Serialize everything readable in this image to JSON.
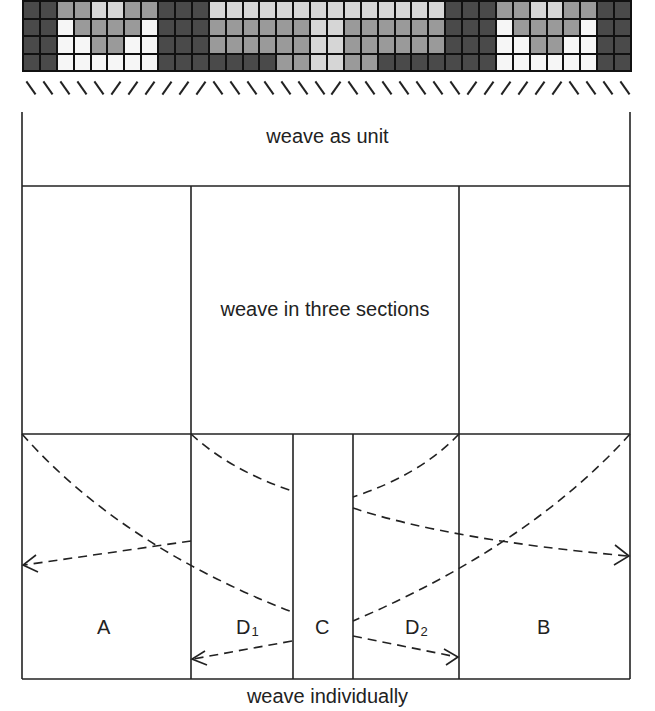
{
  "grid": {
    "columns": 36,
    "rows": 4,
    "shade_key": {
      "D": "#4a4a4a",
      "M": "#9a9a9a",
      "L": "#d6d6d6",
      "W": "#f6f6f6"
    },
    "cells": [
      "DDMMLLMMDDDLLLLLLLLLLLLLLDDDMMLLMMDD",
      "DDWMMMMWDDDMMMMMMLLMMMMMMDDDWMMMMWDD",
      "DDWWMMWWDDDMMMMMMLLMMMMMMDDDWWMMWWDD",
      "DDWWWWWWDDDDDDDMMLLMMDDDDDDDWWWWWWDD"
    ]
  },
  "ticks": "bbbbbffffffbbbbbbbfbbbbbbbffffffbbbb",
  "labels": {
    "unit": "weave as unit",
    "three_sections": "weave in three sections",
    "individually": "weave individually",
    "a": "A",
    "b": "B",
    "c": "C",
    "d1": "D",
    "d1_sub": "1",
    "d2": "D",
    "d2_sub": "2"
  }
}
